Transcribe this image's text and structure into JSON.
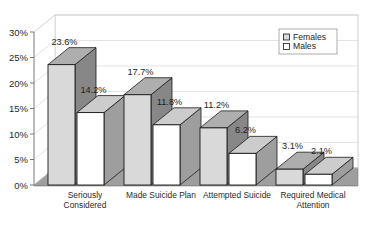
{
  "chart_data": {
    "type": "bar",
    "title": "",
    "subtitle": "",
    "xlabel": "",
    "ylabel": "",
    "categories": [
      "Seriously Considered",
      "Made Suicide Plan",
      "Attempted Suicide",
      "Required Medical Attention"
    ],
    "category_lines": [
      [
        "Seriously",
        "Considered"
      ],
      [
        "Made Suicide Plan"
      ],
      [
        "Attempted Suicide"
      ],
      [
        "Required Medical",
        "Attention"
      ]
    ],
    "series": [
      {
        "name": "Females",
        "values": [
          23.6,
          17.7,
          11.2,
          3.1
        ],
        "labels": [
          "23.6%",
          "17.7%",
          "11.2%",
          "3.1%"
        ],
        "color": "#d9d9d9"
      },
      {
        "name": "Males",
        "values": [
          14.2,
          11.8,
          6.2,
          2.1
        ],
        "labels": [
          "14.2%",
          "11.8%",
          "6.2%",
          "2.1%"
        ],
        "color": "#ffffff"
      }
    ],
    "ylim": [
      0,
      30
    ],
    "ytick_values": [
      0,
      5,
      10,
      15,
      20,
      25,
      30
    ],
    "ytick_labels": [
      "0%",
      "5%",
      "10%",
      "15%",
      "20%",
      "25%",
      "30%"
    ],
    "grid": true,
    "legend_position": "top-right",
    "style": "3d-column",
    "floor_color": "#9a9a9a",
    "wall_color": "#ffffff",
    "outline_color": "#1a1a1a"
  },
  "legend": {
    "entries": [
      {
        "label": "Females",
        "swatch": "#d9d9d9"
      },
      {
        "label": "Males",
        "swatch": "#ffffff"
      }
    ]
  },
  "axis": {
    "y_labels": [
      "30%",
      "25%",
      "20%",
      "15%",
      "10%",
      "5%",
      "0%"
    ]
  }
}
